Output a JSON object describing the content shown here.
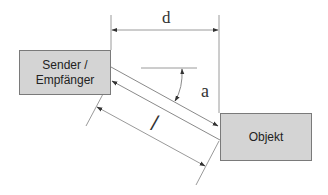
{
  "diagram": {
    "type": "measurement-geometry",
    "colors": {
      "box_fill": "#d4d4d4",
      "box_border": "#7a7a7a",
      "line": "#9a9a9a",
      "arrow": "#333333",
      "text": "#333333"
    },
    "nodes": {
      "sender": {
        "line1": "Sender /",
        "line2": "Empfänger"
      },
      "object": {
        "label": "Objekt"
      }
    },
    "labels": {
      "distance": "d",
      "angle": "a",
      "length": "l"
    },
    "edges": [
      {
        "from": "sender",
        "to": "object",
        "kind": "signal-out"
      },
      {
        "from": "object",
        "to": "sender",
        "kind": "signal-return"
      }
    ],
    "dimensions": [
      {
        "name": "d",
        "meaning": "horizontal distance"
      },
      {
        "name": "l",
        "meaning": "slant path length"
      },
      {
        "name": "a",
        "meaning": "angle from horizontal"
      }
    ]
  }
}
